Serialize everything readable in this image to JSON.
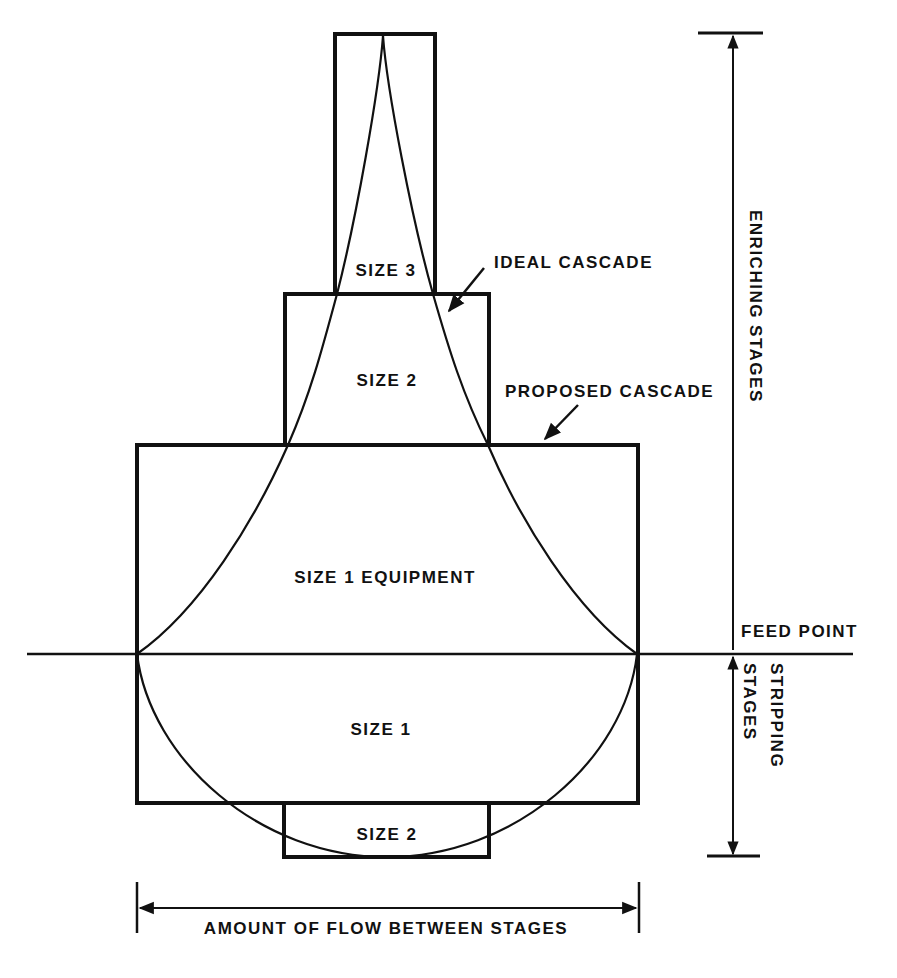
{
  "diagram": {
    "labels": {
      "size3_top": "SIZE 3",
      "size2_top": "SIZE 2",
      "size1_equipment": "SIZE 1 EQUIPMENT",
      "size1_bottom": "SIZE 1",
      "size2_bottom": "SIZE 2",
      "ideal_cascade": "IDEAL CASCADE",
      "proposed_cascade": "PROPOSED CASCADE",
      "feed_point": "FEED POINT",
      "enriching_stages": "ENRICHING STAGES",
      "stripping": "STRIPPING",
      "stripping_stages": "STAGES",
      "x_axis": "AMOUNT OF FLOW BETWEEN STAGES"
    },
    "colors": {
      "ink": "#111111",
      "background": "#ffffff"
    },
    "proposed_cascade_boxes": [
      {
        "name": "size-3",
        "x": 335,
        "y": 34,
        "w": 100,
        "h": 260
      },
      {
        "name": "size-2-upper",
        "x": 285,
        "y": 294,
        "w": 204,
        "h": 151
      },
      {
        "name": "size-1",
        "x": 137,
        "y": 445,
        "w": 501,
        "h": 358
      },
      {
        "name": "size-2-lower",
        "x": 284,
        "y": 803,
        "w": 205,
        "h": 54
      }
    ],
    "feed_line_y": 654
  }
}
